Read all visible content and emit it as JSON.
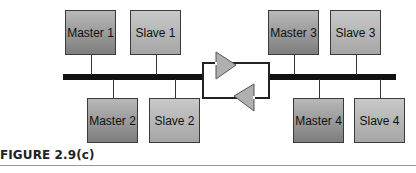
{
  "diagram": {
    "nodes": [
      {
        "id": "master1",
        "label": "Master 1",
        "type": "master",
        "side": "left",
        "position": "top"
      },
      {
        "id": "slave1",
        "label": "Slave 1",
        "type": "slave",
        "side": "left",
        "position": "top"
      },
      {
        "id": "master2",
        "label": "Master 2",
        "type": "master",
        "side": "left",
        "position": "bottom"
      },
      {
        "id": "slave2",
        "label": "Slave 2",
        "type": "slave",
        "side": "left",
        "position": "bottom"
      },
      {
        "id": "master3",
        "label": "Master 3",
        "type": "master",
        "side": "right",
        "position": "top"
      },
      {
        "id": "slave3",
        "label": "Slave 3",
        "type": "slave",
        "side": "right",
        "position": "top"
      },
      {
        "id": "master4",
        "label": "Master 4",
        "type": "master",
        "side": "right",
        "position": "bottom"
      },
      {
        "id": "slave4",
        "label": "Slave 4",
        "type": "slave",
        "side": "right",
        "position": "bottom"
      }
    ],
    "buses": [
      "left-bus",
      "right-bus"
    ],
    "repeater": {
      "description": "bidirectional repeater between bus segments"
    },
    "colors": {
      "bus": "#111111",
      "repeater_fill": "#b0b0b0",
      "node_border": "#3a3a3a"
    }
  },
  "caption": {
    "label": "FIGURE 2.9(c)"
  }
}
